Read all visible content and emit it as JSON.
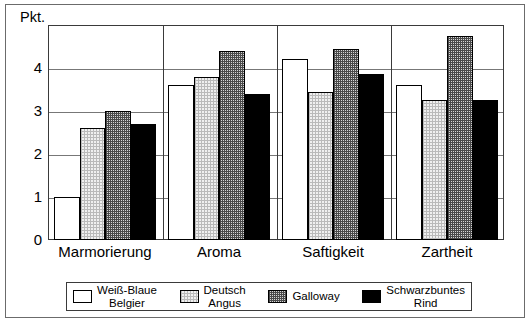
{
  "chart_data": {
    "type": "bar",
    "title": "",
    "xlabel": "",
    "ylabel": "Pkt.",
    "ylim": [
      0,
      5
    ],
    "yticks": [
      "0",
      "1",
      "2",
      "3",
      "4"
    ],
    "grid": true,
    "legend_position": "bottom",
    "categories": [
      "Marmorierung",
      "Aroma",
      "Saftigkeit",
      "Zartheit"
    ],
    "series": [
      {
        "name": "Weiß-Blaue\nBelgier",
        "name_line1": "Weiß-Blaue",
        "name_line2": "Belgier",
        "fill": "white",
        "values": [
          1.0,
          3.6,
          4.2,
          3.6
        ]
      },
      {
        "name": "Deutsch\nAngus",
        "name_line1": "Deutsch",
        "name_line2": "Angus",
        "fill": "light-dotted",
        "values": [
          2.6,
          3.8,
          3.45,
          3.25
        ]
      },
      {
        "name": "Galloway",
        "name_line1": "Galloway",
        "name_line2": "",
        "fill": "mid-checkered",
        "values": [
          3.0,
          4.4,
          4.45,
          4.75
        ]
      },
      {
        "name": "Schwarzbuntes\nRind",
        "name_line1": "Schwarzbuntes",
        "name_line2": "Rind",
        "fill": "black",
        "values": [
          2.7,
          3.4,
          3.85,
          3.25
        ]
      }
    ],
    "colors": {
      "white": "#ffffff",
      "light-dotted": "#efefef",
      "mid-checkered": "#d6d6d6",
      "black": "#000000",
      "gridline": "#777777",
      "axis": "#3a3a3a"
    }
  },
  "axis": {
    "unit_label": "Pkt.",
    "ticks": [
      {
        "label": "4",
        "value": 4
      },
      {
        "label": "3",
        "value": 3
      },
      {
        "label": "2",
        "value": 2
      },
      {
        "label": "1",
        "value": 1
      },
      {
        "label": "0",
        "value": 0
      }
    ]
  },
  "legend": {
    "items": [
      {
        "label_line1": "Weiß-Blaue",
        "label_line2": "Belgier",
        "fill": "white"
      },
      {
        "label_line1": "Deutsch",
        "label_line2": "Angus",
        "fill": "light-dotted"
      },
      {
        "label_line1": "Galloway",
        "label_line2": "",
        "fill": "mid-checkered"
      },
      {
        "label_line1": "Schwarzbuntes",
        "label_line2": "Rind",
        "fill": "black"
      }
    ]
  }
}
